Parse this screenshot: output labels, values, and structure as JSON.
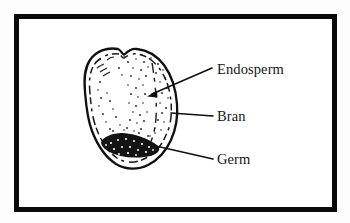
{
  "figure": {
    "background_color": "#fdfdfd",
    "ink_color": "#101010",
    "frame": {
      "name": "diagram-border",
      "x": 14,
      "y": 14,
      "width": 323,
      "height": 198,
      "stroke_width": 5,
      "stroke_color": "#0a0a0a",
      "fill_color": "#ffffff"
    },
    "illustration": {
      "name": "grain-kernel-illustration",
      "style": "hand-drawn line art with stipple shading",
      "bounds": {
        "x": 84,
        "y": 48,
        "width": 94,
        "height": 122
      },
      "parts": [
        {
          "id": "bran",
          "label": "Bran",
          "description": "outer shell layer drawn as a double outline around the kernel"
        },
        {
          "id": "endosperm",
          "label": "Endosperm",
          "description": "large stippled interior region filling most of the kernel"
        },
        {
          "id": "germ",
          "label": "Germ",
          "description": "dark textured blob at the lower-left of the kernel"
        }
      ]
    },
    "labels": [
      {
        "id": "endosperm",
        "text": "Endosperm",
        "text_x": 217,
        "text_y": 74,
        "leader": {
          "type": "arrow",
          "x1": 212,
          "y1": 68,
          "x2": 149,
          "y2": 96
        }
      },
      {
        "id": "bran",
        "text": "Bran",
        "text_x": 217,
        "text_y": 121,
        "leader": {
          "type": "line",
          "x1": 213,
          "y1": 116,
          "x2": 171,
          "y2": 113
        }
      },
      {
        "id": "germ",
        "text": "Germ",
        "text_x": 217,
        "text_y": 164,
        "leader": {
          "type": "line",
          "x1": 213,
          "y1": 159,
          "x2": 147,
          "y2": 144
        }
      }
    ]
  }
}
